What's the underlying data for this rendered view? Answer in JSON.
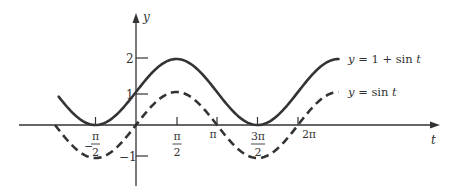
{
  "chart_data": {
    "type": "line",
    "title": "",
    "xlabel": "t",
    "ylabel": "y",
    "x_ticks": [
      "-π/2",
      "π/2",
      "π",
      "3π/2",
      "2π"
    ],
    "x_tick_values": [
      -1.5708,
      1.5708,
      3.1416,
      4.7124,
      6.2832
    ],
    "y_ticks": [
      "2",
      "1",
      "-1"
    ],
    "y_tick_values": [
      2,
      1,
      -1
    ],
    "xlim": [
      -3.6,
      8.5
    ],
    "ylim": [
      -1.8,
      3.3
    ],
    "grid": false,
    "legend_position": "inline-right",
    "series": [
      {
        "name": "y = 1 + sin t",
        "style": "solid",
        "color": "#333333",
        "function": "1 + sin(t)",
        "x_range": [
          -3.0,
          7.854
        ],
        "points": [
          [
            -3.0,
            0.86
          ],
          [
            -1.5708,
            0
          ],
          [
            0,
            1
          ],
          [
            1.5708,
            2
          ],
          [
            3.1416,
            1
          ],
          [
            4.7124,
            0
          ],
          [
            6.2832,
            1
          ],
          [
            7.854,
            2
          ]
        ]
      },
      {
        "name": "y = sin t",
        "style": "dashed",
        "color": "#333333",
        "function": "sin(t)",
        "x_range": [
          -3.1416,
          7.854
        ],
        "points": [
          [
            -3.1416,
            0
          ],
          [
            -1.5708,
            -1
          ],
          [
            0,
            0
          ],
          [
            1.5708,
            1
          ],
          [
            3.1416,
            0
          ],
          [
            4.7124,
            -1
          ],
          [
            6.2832,
            0
          ],
          [
            7.854,
            1
          ]
        ]
      }
    ]
  },
  "labels": {
    "y_axis": "y",
    "x_axis": "t",
    "tick_2": "2",
    "tick_1": "1",
    "tick_neg1": "−1",
    "pi": "π",
    "two_pi": "2π",
    "num_pi": "π",
    "num_3pi": "3π",
    "den_2": "2",
    "minus": "−",
    "legend_solid": "y = 1 + sin t",
    "legend_dashed": "y = sin t"
  }
}
